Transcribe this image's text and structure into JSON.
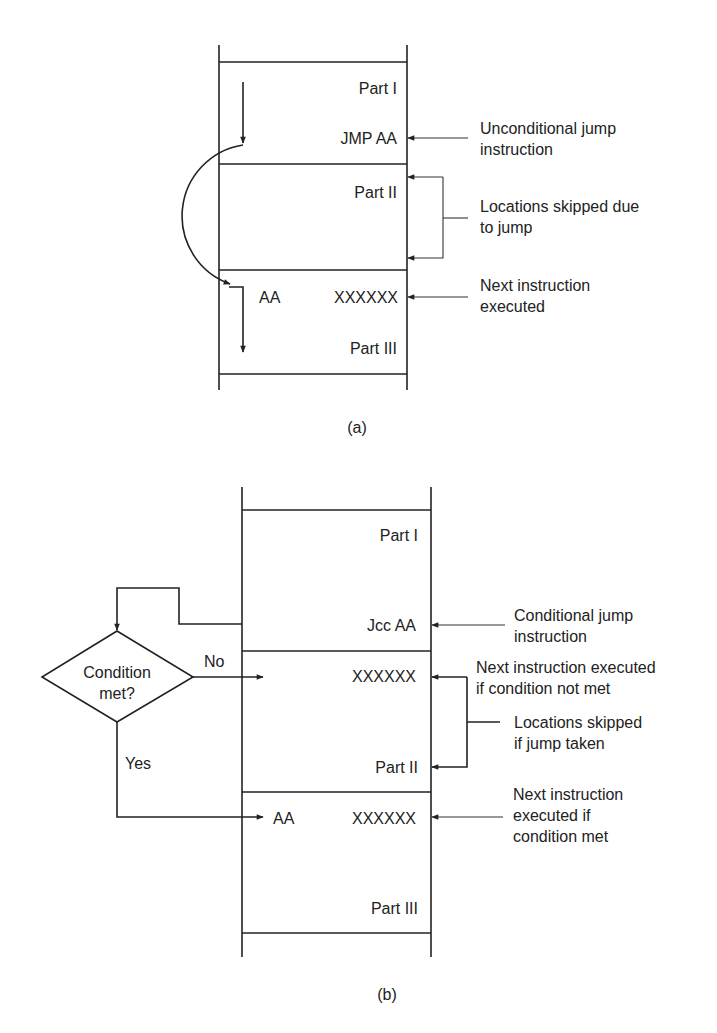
{
  "figure_a": {
    "caption": "(a)",
    "memory": {
      "part1": "Part I",
      "jump_instruction": "JMP AA",
      "part2": "Part II",
      "target_label": "AA",
      "target_instruction": "XXXXXX",
      "part3": "Part III"
    },
    "annotations": {
      "unconditional_jump": [
        "Unconditional jump",
        "instruction"
      ],
      "skipped": [
        "Locations skipped due",
        "to jump"
      ],
      "next_executed": [
        "Next instruction",
        "executed"
      ]
    }
  },
  "figure_b": {
    "caption": "(b)",
    "decision": {
      "text": [
        "Condition",
        "met?"
      ],
      "no_label": "No",
      "yes_label": "Yes"
    },
    "memory": {
      "part1": "Part I",
      "jump_instruction": "Jcc AA",
      "fallthrough_instruction": "XXXXXX",
      "part2": "Part II",
      "target_label": "AA",
      "target_instruction": "XXXXXX",
      "part3": "Part III"
    },
    "annotations": {
      "conditional_jump": [
        "Conditional jump",
        "instruction"
      ],
      "next_if_not_met": [
        "Next instruction executed",
        "if condition not met"
      ],
      "skipped": [
        "Locations skipped",
        "if jump taken"
      ],
      "next_if_met": [
        "Next instruction",
        "executed if",
        "condition met"
      ]
    }
  }
}
